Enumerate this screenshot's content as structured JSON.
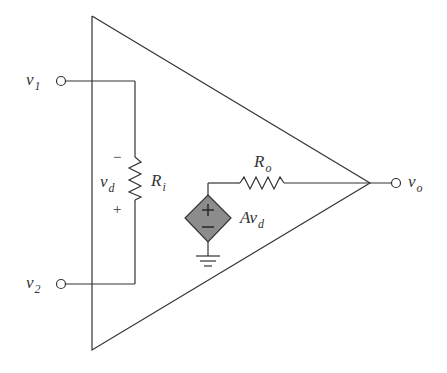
{
  "diagram": {
    "labels": {
      "v1": {
        "main": "v",
        "sub": "1"
      },
      "v2": {
        "main": "v",
        "sub": "2"
      },
      "vd": {
        "main": "v",
        "sub": "d"
      },
      "Ri": {
        "main": "R",
        "sub": "i"
      },
      "Ro": {
        "main": "R",
        "sub": "o"
      },
      "vo": {
        "main": "v",
        "sub": "o"
      },
      "Avd": {
        "main": "Av",
        "sub": "d"
      }
    },
    "polarity": {
      "vd_top": "−",
      "vd_bottom": "+",
      "source_top": "+",
      "source_bottom": "−"
    },
    "colors": {
      "stroke": "#333333",
      "source_fill": "#8c8c8c"
    },
    "components": [
      {
        "id": "Ri",
        "type": "resistor",
        "between": [
          "v1",
          "v2"
        ]
      },
      {
        "id": "dependent_source",
        "type": "voltage-controlled voltage source",
        "value": "Av_d"
      },
      {
        "id": "Ro",
        "type": "resistor",
        "between": [
          "source",
          "vo"
        ]
      },
      {
        "id": "ground",
        "type": "ground"
      }
    ]
  }
}
